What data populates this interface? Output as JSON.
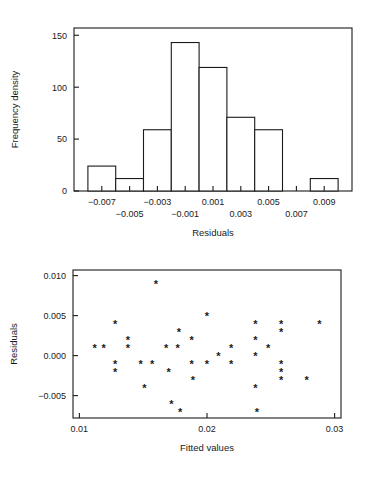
{
  "figure": {
    "background": "#ffffff",
    "ink_color": "#1a1a1a"
  },
  "chart_data": [
    {
      "id": "residual-histogram",
      "type": "bar",
      "title": "",
      "xlabel": "Residuals",
      "ylabel": "Frequency density",
      "grid": false,
      "legend": "none",
      "xlim": [
        -0.009,
        0.011
      ],
      "ylim": [
        0,
        157
      ],
      "xticks": [
        -0.007,
        -0.005,
        -0.003,
        -0.001,
        0.001,
        0.003,
        0.005,
        0.007,
        0.009
      ],
      "xticklabels": [
        "-0.007",
        "-0.005",
        "-0.003",
        "-0.001",
        "0.001",
        "0.003",
        "0.005",
        "0.007",
        "0.009"
      ],
      "xtick_label_rows": [
        0,
        1,
        0,
        1,
        0,
        1,
        0,
        1,
        0
      ],
      "yticks": [
        0,
        50,
        100,
        150
      ],
      "yticklabels": [
        "0",
        "50",
        "100",
        "150"
      ],
      "bin_width": 0.002,
      "bin_edges": [
        -0.008,
        -0.006,
        -0.004,
        -0.002,
        0.0,
        0.002,
        0.004,
        0.006,
        0.008,
        0.01
      ],
      "bin_centers": [
        -0.007,
        -0.005,
        -0.003,
        -0.001,
        0.001,
        0.003,
        0.005,
        0.007,
        0.009
      ],
      "values": [
        24,
        12,
        59,
        143,
        119,
        71,
        59,
        0,
        12
      ],
      "categories": [
        "-0.007",
        "-0.005",
        "-0.003",
        "-0.001",
        "0.001",
        "0.003",
        "0.005",
        "0.007",
        "0.009"
      ]
    },
    {
      "id": "residuals-vs-fitted-scatter",
      "type": "scatter",
      "title": "",
      "xlabel": "Fitted values",
      "ylabel": "Residuals",
      "grid": false,
      "legend": "none",
      "marker": "*",
      "xlim": [
        0.0095,
        0.0305
      ],
      "ylim": [
        -0.0078,
        0.0107
      ],
      "xticks": [
        0.01,
        0.02,
        0.03
      ],
      "xticklabels": [
        "0.01",
        "0.02",
        "0.03"
      ],
      "yticks": [
        -0.005,
        0.0,
        0.005,
        0.01
      ],
      "yticklabels": [
        "-0.005",
        "0.000",
        "0.005",
        "0.010"
      ],
      "points": [
        {
          "x": 0.0112,
          "y": 0.001
        },
        {
          "x": 0.0119,
          "y": 0.001
        },
        {
          "x": 0.0128,
          "y": 0.004
        },
        {
          "x": 0.0128,
          "y": -0.001
        },
        {
          "x": 0.0128,
          "y": -0.002
        },
        {
          "x": 0.0138,
          "y": 0.002
        },
        {
          "x": 0.0138,
          "y": 0.001
        },
        {
          "x": 0.0148,
          "y": -0.001
        },
        {
          "x": 0.0151,
          "y": -0.004
        },
        {
          "x": 0.0157,
          "y": -0.001
        },
        {
          "x": 0.016,
          "y": 0.009
        },
        {
          "x": 0.0168,
          "y": 0.001
        },
        {
          "x": 0.017,
          "y": -0.002
        },
        {
          "x": 0.0172,
          "y": -0.006
        },
        {
          "x": 0.0177,
          "y": 0.001
        },
        {
          "x": 0.0178,
          "y": 0.003
        },
        {
          "x": 0.0179,
          "y": -0.007
        },
        {
          "x": 0.0188,
          "y": 0.002
        },
        {
          "x": 0.0188,
          "y": -0.001
        },
        {
          "x": 0.0189,
          "y": -0.003
        },
        {
          "x": 0.02,
          "y": 0.005
        },
        {
          "x": 0.02,
          "y": -0.001
        },
        {
          "x": 0.0209,
          "y": 0.0
        },
        {
          "x": 0.0219,
          "y": 0.001
        },
        {
          "x": 0.0219,
          "y": -0.001
        },
        {
          "x": 0.0238,
          "y": 0.004
        },
        {
          "x": 0.0238,
          "y": 0.002
        },
        {
          "x": 0.0238,
          "y": 0.0
        },
        {
          "x": 0.0238,
          "y": -0.004
        },
        {
          "x": 0.0239,
          "y": -0.007
        },
        {
          "x": 0.0248,
          "y": 0.001
        },
        {
          "x": 0.0258,
          "y": 0.004
        },
        {
          "x": 0.0258,
          "y": 0.003
        },
        {
          "x": 0.0258,
          "y": -0.001
        },
        {
          "x": 0.0258,
          "y": -0.002
        },
        {
          "x": 0.0258,
          "y": -0.003
        },
        {
          "x": 0.0278,
          "y": -0.003
        },
        {
          "x": 0.0288,
          "y": 0.004
        }
      ]
    }
  ]
}
